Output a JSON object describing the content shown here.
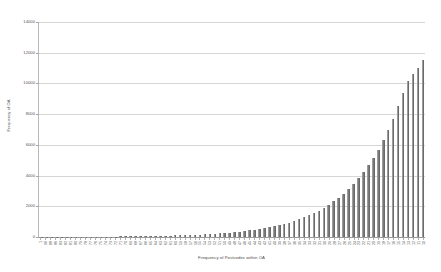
{
  "chart_data": {
    "type": "bar",
    "title": "",
    "subtitle": "",
    "xlabel": "Frequency of Postcodes within OA",
    "ylabel": "Frequency of OA",
    "ylim": [
      0,
      14000
    ],
    "ytick_values": [
      0,
      2000,
      4000,
      6000,
      8000,
      10000,
      12000,
      14000
    ],
    "ytick_labels": [
      "0",
      "2000",
      "4000",
      "6000",
      "8000",
      "10000",
      "12000",
      "14000"
    ],
    "grid": true,
    "grid_axis": "y",
    "legend": false,
    "legend_position": "none",
    "bar_color": "#7a7a7a",
    "categories": [
      "1",
      "96",
      "88",
      "86",
      "83",
      "82",
      "81",
      "80",
      "79",
      "78",
      "77",
      "76",
      "75",
      "74",
      "73",
      "72",
      "71",
      "70",
      "69",
      "68",
      "67",
      "66",
      "65",
      "64",
      "63",
      "62",
      "61",
      "60",
      "59",
      "58",
      "57",
      "56",
      "55",
      "54",
      "53",
      "52",
      "51",
      "50",
      "49",
      "48",
      "47",
      "46",
      "45",
      "44",
      "43",
      "42",
      "41",
      "40",
      "39",
      "38",
      "37",
      "36",
      "35",
      "34",
      "33",
      "32",
      "31",
      "30",
      "29",
      "28",
      "27",
      "26",
      "25",
      "24",
      "23",
      "22",
      "21",
      "20",
      "19",
      "18",
      "17",
      "16",
      "15",
      "14",
      "13",
      "12",
      "11",
      "10"
    ],
    "values": [
      5,
      6,
      7,
      8,
      9,
      10,
      11,
      12,
      14,
      16,
      18,
      20,
      22,
      25,
      28,
      31,
      34,
      38,
      42,
      46,
      51,
      56,
      62,
      68,
      75,
      82,
      90,
      99,
      109,
      120,
      132,
      145,
      160,
      176,
      194,
      214,
      236,
      260,
      287,
      316,
      349,
      385,
      425,
      470,
      519,
      573,
      633,
      700,
      773,
      854,
      944,
      1043,
      1152,
      1273,
      1407,
      1555,
      1718,
      1898,
      2097,
      2317,
      2560,
      2829,
      3126,
      3455,
      3818,
      4220,
      4664,
      5155,
      5697,
      6296,
      6958,
      7690,
      8499,
      9394,
      10150,
      10640,
      11000,
      11500
    ],
    "values_note": "Sorted ascending distribution; rightmost bar peaks near 11500, long near-zero tail on the left.",
    "bar_count": 78
  }
}
